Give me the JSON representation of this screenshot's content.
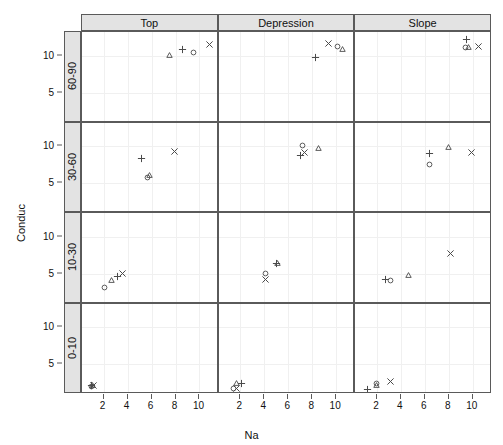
{
  "chart_data": {
    "type": "scatter",
    "title": "",
    "xlabel": "Na",
    "ylabel": "Conduc",
    "layout": "trellis-matrix",
    "grid": true,
    "legend": "none",
    "columns": [
      "Top",
      "Depression",
      "Slope"
    ],
    "rows": [
      "60-90",
      "30-60",
      "10-30",
      "0-10"
    ],
    "row_order_top_to_bottom": [
      "60-90",
      "30-60",
      "10-30",
      "0-10"
    ],
    "xlim": [
      0.2,
      11.6
    ],
    "ylim": [
      1.0,
      13.2
    ],
    "xticks": [
      2,
      4,
      6,
      8,
      10
    ],
    "yticks": [
      5,
      10
    ],
    "marker_shapes": [
      "circle",
      "triangle",
      "plus",
      "cross"
    ],
    "panels": [
      {
        "row": "60-90",
        "column": "Top",
        "points": [
          {
            "shape": "triangle",
            "x": 7.5,
            "y": 10.0
          },
          {
            "shape": "plus",
            "x": 8.6,
            "y": 10.9
          },
          {
            "shape": "circle",
            "x": 9.5,
            "y": 10.4
          },
          {
            "shape": "cross",
            "x": 10.8,
            "y": 11.5
          }
        ]
      },
      {
        "row": "60-90",
        "column": "Depression",
        "points": [
          {
            "shape": "plus",
            "x": 8.3,
            "y": 9.8
          },
          {
            "shape": "cross",
            "x": 9.4,
            "y": 11.6
          },
          {
            "shape": "circle",
            "x": 10.1,
            "y": 11.3
          },
          {
            "shape": "triangle",
            "x": 10.5,
            "y": 10.9
          }
        ]
      },
      {
        "row": "60-90",
        "column": "Slope",
        "points": [
          {
            "shape": "plus",
            "x": 9.5,
            "y": 12.2
          },
          {
            "shape": "circle",
            "x": 9.4,
            "y": 11.1
          },
          {
            "shape": "triangle",
            "x": 9.6,
            "y": 11.1
          },
          {
            "shape": "cross",
            "x": 10.5,
            "y": 11.2
          }
        ]
      },
      {
        "row": "30-60",
        "column": "Top",
        "points": [
          {
            "shape": "plus",
            "x": 5.2,
            "y": 8.4
          },
          {
            "shape": "circle",
            "x": 5.7,
            "y": 5.8
          },
          {
            "shape": "triangle",
            "x": 5.8,
            "y": 6.1
          },
          {
            "shape": "cross",
            "x": 7.9,
            "y": 9.3
          }
        ]
      },
      {
        "row": "30-60",
        "column": "Depression",
        "points": [
          {
            "shape": "plus",
            "x": 7.0,
            "y": 8.7
          },
          {
            "shape": "circle",
            "x": 7.2,
            "y": 10.1
          },
          {
            "shape": "cross",
            "x": 7.4,
            "y": 9.2
          },
          {
            "shape": "triangle",
            "x": 8.5,
            "y": 9.7
          }
        ]
      },
      {
        "row": "30-60",
        "column": "Slope",
        "points": [
          {
            "shape": "plus",
            "x": 6.4,
            "y": 9.0
          },
          {
            "shape": "circle",
            "x": 6.4,
            "y": 7.6
          },
          {
            "shape": "triangle",
            "x": 8.0,
            "y": 9.8
          },
          {
            "shape": "cross",
            "x": 9.9,
            "y": 9.2
          }
        ]
      },
      {
        "row": "10-30",
        "column": "Top",
        "points": [
          {
            "shape": "circle",
            "x": 2.1,
            "y": 3.2
          },
          {
            "shape": "triangle",
            "x": 2.7,
            "y": 4.1
          },
          {
            "shape": "plus",
            "x": 3.2,
            "y": 4.6
          },
          {
            "shape": "cross",
            "x": 3.6,
            "y": 5.1
          }
        ]
      },
      {
        "row": "10-30",
        "column": "Depression",
        "points": [
          {
            "shape": "cross",
            "x": 4.1,
            "y": 4.2
          },
          {
            "shape": "circle",
            "x": 4.1,
            "y": 5.0
          },
          {
            "shape": "plus",
            "x": 5.0,
            "y": 6.4
          },
          {
            "shape": "triangle",
            "x": 5.1,
            "y": 6.4
          }
        ]
      },
      {
        "row": "10-30",
        "column": "Slope",
        "points": [
          {
            "shape": "plus",
            "x": 2.7,
            "y": 4.3
          },
          {
            "shape": "circle",
            "x": 3.1,
            "y": 4.1
          },
          {
            "shape": "triangle",
            "x": 4.6,
            "y": 4.8
          },
          {
            "shape": "cross",
            "x": 8.1,
            "y": 7.7
          }
        ]
      },
      {
        "row": "0-10",
        "column": "Top",
        "points": [
          {
            "shape": "circle",
            "x": 1.0,
            "y": 2.0
          },
          {
            "shape": "triangle",
            "x": 1.05,
            "y": 2.1
          },
          {
            "shape": "plus",
            "x": 1.0,
            "y": 2.2
          },
          {
            "shape": "cross",
            "x": 1.2,
            "y": 2.2
          }
        ]
      },
      {
        "row": "0-10",
        "column": "Depression",
        "points": [
          {
            "shape": "circle",
            "x": 1.4,
            "y": 1.7
          },
          {
            "shape": "cross",
            "x": 1.7,
            "y": 1.7
          },
          {
            "shape": "triangle",
            "x": 1.7,
            "y": 2.4
          },
          {
            "shape": "plus",
            "x": 2.1,
            "y": 2.4
          }
        ]
      },
      {
        "row": "0-10",
        "column": "Slope",
        "points": [
          {
            "shape": "plus",
            "x": 1.2,
            "y": 1.6
          },
          {
            "shape": "circle",
            "x": 2.0,
            "y": 2.4
          },
          {
            "shape": "triangle",
            "x": 2.0,
            "y": 2.1
          },
          {
            "shape": "cross",
            "x": 3.1,
            "y": 2.7
          }
        ]
      }
    ]
  },
  "axes": {
    "x_label": "Na",
    "y_label": "Conduc",
    "x_tick_labels": [
      "2",
      "4",
      "6",
      "8",
      "10"
    ],
    "y_tick_labels": [
      "5",
      "10"
    ]
  },
  "strips": {
    "columns": [
      "Top",
      "Depression",
      "Slope"
    ],
    "rows": [
      "60-90",
      "30-60",
      "10-30",
      "0-10"
    ]
  },
  "colors": {
    "panel_border": "#5a5a5a",
    "strip_background": "#e3e3e3",
    "gridline": "#f0f0f0",
    "marker": "#4a4a4a",
    "text": "#111111",
    "background": "#ffffff"
  }
}
